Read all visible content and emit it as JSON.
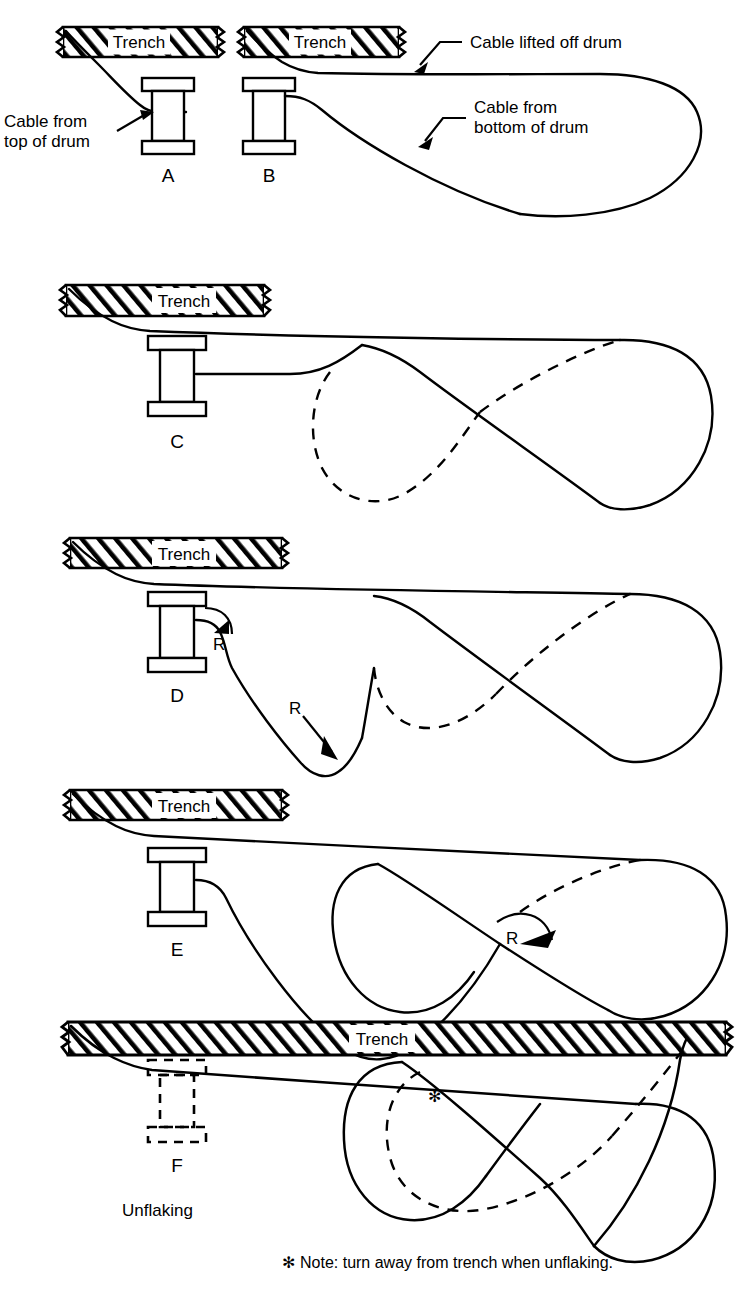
{
  "figure": {
    "title_implicit": "Cable unflaking / flaking-out patterns relative to trench",
    "note": "Note: turn away from trench when unflaking.",
    "note_marker": "✻",
    "caption_unflaking": "Unflaking"
  },
  "labels": {
    "trench": "Trench",
    "radius": "R",
    "cable_from_top_of_drum_line1": "Cable from",
    "cable_from_top_of_drum_line2": "top of drum",
    "cable_lifted_off_drum": "Cable lifted off drum",
    "cable_from_bottom_line1": "Cable from",
    "cable_from_bottom_line2": "bottom of drum"
  },
  "panels": [
    {
      "id": "A",
      "letter": "A",
      "trench_label": "Trench",
      "description": "Drum with cable paying off the top of the drum into the trench; short run, no flake loops.",
      "has_loops": false,
      "loop_count": 0,
      "dashed_drum": false,
      "radius_marks": 0
    },
    {
      "id": "B",
      "letter": "B",
      "trench_label": "Trench",
      "description": "Cable lifted off drum runs along trench then returns as one large single loop from the bottom of the drum.",
      "has_loops": true,
      "loop_count": 1,
      "dashed_drum": false,
      "radius_marks": 0
    },
    {
      "id": "C",
      "letter": "C",
      "trench_label": "Trench",
      "description": "Cable from drum forms a figure-eight flake with one dashed (hidden) loop and one solid loop.",
      "has_loops": true,
      "loop_count": 2,
      "dashed_drum": false,
      "radius_marks": 0
    },
    {
      "id": "D",
      "letter": "D",
      "trench_label": "Trench",
      "description": "Figure-eight flake with two marked bend radii R — one at the drum exit and one at the bottom reversal.",
      "has_loops": true,
      "loop_count": 2,
      "dashed_drum": false,
      "radius_marks": 2
    },
    {
      "id": "E",
      "letter": "E",
      "trench_label": "Trench",
      "description": "Figure-eight flake with a single small radius R marked at the central crossover.",
      "has_loops": true,
      "loop_count": 2,
      "dashed_drum": false,
      "radius_marks": 1
    },
    {
      "id": "F",
      "letter": "F",
      "trench_label": "Trench",
      "description": "Drum removed (shown dashed); full figure-eight flake laid alongside a long trench, cable exiting at the far right end. Asterisk marks the turn direction away from the trench.",
      "has_loops": true,
      "loop_count": 2,
      "dashed_drum": true,
      "radius_marks": 0,
      "marker": "✻"
    }
  ],
  "colors": {
    "ink": "#000000",
    "paper": "#ffffff"
  }
}
